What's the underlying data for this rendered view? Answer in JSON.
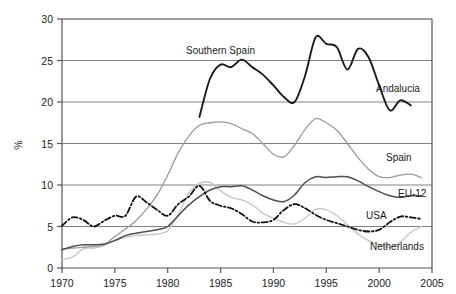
{
  "chart_data": {
    "type": "line",
    "title": "",
    "xlabel": "",
    "ylabel": "%",
    "xlim": [
      1970,
      2005
    ],
    "ylim": [
      0,
      30
    ],
    "xticks": [
      1970,
      1975,
      1980,
      1985,
      1990,
      1995,
      2000,
      2005
    ],
    "yticks": [
      0,
      5,
      10,
      15,
      20,
      25,
      30
    ],
    "grid": "horizontal",
    "legend": "inline-labels",
    "series": [
      {
        "name": "Andalucia",
        "label": "Andalucia",
        "second_label": "Southern Spain",
        "style": "solid-bold-black",
        "color": "#1a1a1a",
        "x": [
          1983,
          1984,
          1985,
          1986,
          1987,
          1988,
          1989,
          1990,
          1991,
          1992,
          1993,
          1994,
          1995,
          1996,
          1997,
          1998,
          1999,
          2000,
          2001,
          2002,
          2003
        ],
        "y": [
          18.2,
          22.8,
          24.5,
          24.2,
          25.1,
          24.2,
          23.3,
          22.0,
          20.6,
          20.0,
          23.2,
          27.8,
          27.0,
          26.6,
          23.9,
          26.4,
          25.4,
          22.0,
          19.0,
          20.2,
          19.6
        ]
      },
      {
        "name": "Spain",
        "label": "Spain",
        "style": "solid-gray",
        "color": "#9a9a9a",
        "x": [
          1970,
          1971,
          1972,
          1973,
          1974,
          1975,
          1976,
          1977,
          1978,
          1979,
          1980,
          1981,
          1982,
          1983,
          1984,
          1985,
          1986,
          1987,
          1988,
          1989,
          1990,
          1991,
          1992,
          1993,
          1994,
          1995,
          1996,
          1997,
          1998,
          1999,
          2000,
          2001,
          2002,
          2003,
          2004
        ],
        "y": [
          2.3,
          2.4,
          2.5,
          2.6,
          2.8,
          3.8,
          4.7,
          5.7,
          7.1,
          8.8,
          11.2,
          13.9,
          15.9,
          17.2,
          17.5,
          17.6,
          17.4,
          16.8,
          16.2,
          15.0,
          13.7,
          13.4,
          14.8,
          16.7,
          18.0,
          17.5,
          16.6,
          15.0,
          13.3,
          11.9,
          11.0,
          10.9,
          11.2,
          11.3,
          10.9
        ]
      },
      {
        "name": "EU-12",
        "label": "EU-12",
        "style": "solid-darkgray",
        "color": "#4d4d4d",
        "x": [
          1970,
          1971,
          1972,
          1973,
          1974,
          1975,
          1976,
          1977,
          1978,
          1979,
          1980,
          1981,
          1982,
          1983,
          1984,
          1985,
          1986,
          1987,
          1988,
          1989,
          1990,
          1991,
          1992,
          1993,
          1994,
          1995,
          1996,
          1997,
          1998,
          1999,
          2000,
          2001,
          2002,
          2003,
          2004
        ],
        "y": [
          2.2,
          2.6,
          2.8,
          2.8,
          2.9,
          3.3,
          3.9,
          4.2,
          4.4,
          4.6,
          5.0,
          6.3,
          7.6,
          8.6,
          9.4,
          9.8,
          9.8,
          9.9,
          9.4,
          8.7,
          8.2,
          8.0,
          8.8,
          10.3,
          11.0,
          10.9,
          11.0,
          11.0,
          10.5,
          9.8,
          9.2,
          8.7,
          8.5,
          8.7,
          8.7
        ]
      },
      {
        "name": "USA",
        "label": "USA",
        "style": "dash-dot-black",
        "color": "#111111",
        "x": [
          1970,
          1971,
          1972,
          1973,
          1974,
          1975,
          1976,
          1977,
          1978,
          1979,
          1980,
          1981,
          1982,
          1983,
          1984,
          1985,
          1986,
          1987,
          1988,
          1989,
          1990,
          1991,
          1992,
          1993,
          1994,
          1995,
          1996,
          1997,
          1998,
          1999,
          2000,
          2001,
          2002,
          2003,
          2004
        ],
        "y": [
          5.1,
          6.1,
          5.8,
          5.0,
          5.7,
          6.3,
          6.3,
          8.6,
          7.9,
          7.0,
          6.3,
          7.7,
          8.6,
          9.9,
          8.1,
          7.5,
          7.2,
          6.5,
          5.6,
          5.5,
          5.8,
          7.0,
          7.7,
          7.2,
          6.4,
          5.8,
          5.4,
          5.0,
          4.6,
          4.4,
          4.6,
          5.5,
          6.2,
          6.1,
          5.9
        ]
      },
      {
        "name": "Netherlands",
        "label": "Netherlands",
        "style": "solid-lightgray",
        "color": "#c6c6c6",
        "x": [
          1970,
          1971,
          1972,
          1973,
          1974,
          1975,
          1976,
          1977,
          1978,
          1979,
          1980,
          1981,
          1982,
          1983,
          1984,
          1985,
          1986,
          1987,
          1988,
          1989,
          1990,
          1991,
          1992,
          1993,
          1994,
          1995,
          1996,
          1997,
          1998,
          1999,
          2000,
          2001,
          2002,
          2003,
          2004
        ],
        "y": [
          1.0,
          1.3,
          2.3,
          2.4,
          2.7,
          3.4,
          3.7,
          3.9,
          4.0,
          4.1,
          4.5,
          6.5,
          9.0,
          10.2,
          10.3,
          9.3,
          8.5,
          8.2,
          7.6,
          6.6,
          6.0,
          5.5,
          5.3,
          6.0,
          7.1,
          7.0,
          6.3,
          5.2,
          4.1,
          3.3,
          2.8,
          2.5,
          3.1,
          4.3,
          5.0
        ]
      }
    ]
  },
  "axis": {
    "y_title": "%",
    "y_ticks": [
      "0",
      "5",
      "10",
      "15",
      "20",
      "25",
      "30"
    ],
    "x_ticks": [
      "1970",
      "1975",
      "1980",
      "1985",
      "1990",
      "1995",
      "2000",
      "2005"
    ]
  },
  "annotations": {
    "southern_spain": "Southern Spain",
    "andalucia": "Andalucia",
    "spain": "Spain",
    "eu12": "EU-12",
    "usa": "USA",
    "netherlands": "Netherlands"
  },
  "colors": {
    "andalucia": "#1a1a1a",
    "spain": "#9a9a9a",
    "eu12": "#4d4d4d",
    "usa": "#111111",
    "netherlands": "#c6c6c6",
    "grid": "#808080",
    "axis": "#555555"
  }
}
